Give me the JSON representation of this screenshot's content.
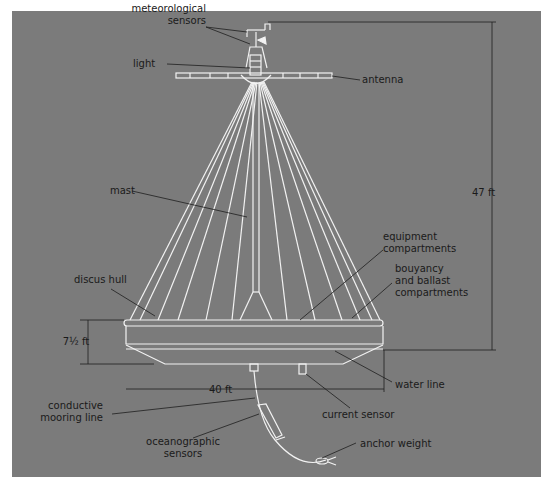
{
  "figure": {
    "background_color": "#7b7b7b",
    "line_color": "#f2f2f2",
    "label_color": "#1a1a1a"
  },
  "labels": {
    "meteorological_sensors": [
      "meteorological",
      "sensors"
    ],
    "light": "light",
    "antenna": "antenna",
    "mast": "mast",
    "equipment_compartments": [
      "equipment",
      "compartments"
    ],
    "bouyancy_ballast": [
      "bouyancy",
      "and ballast",
      "compartments"
    ],
    "discus_hull": "discus hull",
    "water_line": "water line",
    "current_sensor": "current sensor",
    "conductive_mooring_line": [
      "conductive",
      "mooring line"
    ],
    "oceanographic_sensors": [
      "oceanographic",
      "sensors"
    ],
    "anchor_weight": "anchor weight"
  },
  "dimensions": {
    "height_total": "47 ft",
    "hull_height": "7½ ft",
    "hull_diameter": "40 ft"
  }
}
